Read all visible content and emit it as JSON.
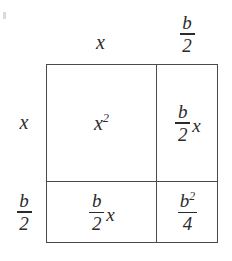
{
  "diagram": {
    "type": "area-model",
    "ink_color": "#4a4a4a",
    "text_color": "#2b2b2b",
    "background_color": "#ffffff",
    "column_labels": [
      {
        "id": "column-label-left",
        "kind": "variable",
        "text": "x"
      },
      {
        "id": "column-label-right",
        "kind": "fraction",
        "numerator": "b",
        "denominator": "2",
        "text": "b/2"
      }
    ],
    "row_labels": [
      {
        "id": "row-label-top",
        "kind": "variable",
        "text": "x"
      },
      {
        "id": "row-label-bottom",
        "kind": "fraction",
        "numerator": "b",
        "denominator": "2",
        "text": "b/2"
      }
    ],
    "cells": [
      {
        "id": "cell-top-left",
        "kind": "power",
        "base": "x",
        "exponent": "2",
        "text": "x^2"
      },
      {
        "id": "cell-top-right",
        "kind": "fraction-times-variable",
        "numerator": "b",
        "denominator": "2",
        "variable": "x",
        "text": "(b/2)x"
      },
      {
        "id": "cell-bottom-left",
        "kind": "fraction-times-variable",
        "numerator": "b",
        "denominator": "2",
        "variable": "x",
        "text": "(b/2)x"
      },
      {
        "id": "cell-bottom-right",
        "kind": "fraction",
        "numerator": "b",
        "numerator_exponent": "2",
        "denominator": "4",
        "text": "b^2/4"
      }
    ]
  }
}
